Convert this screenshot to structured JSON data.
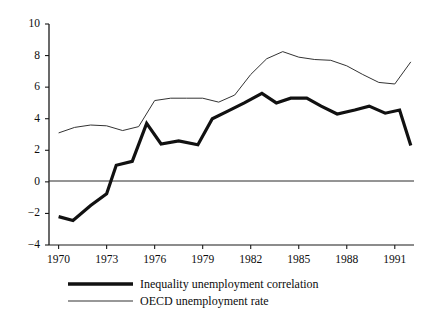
{
  "chart_data": {
    "type": "line",
    "title": "",
    "subtitle": "",
    "xlabel": "",
    "ylabel": "",
    "xlim": [
      1969.4,
      1992.2
    ],
    "ylim": [
      -4,
      10
    ],
    "grid": false,
    "legend_position": "bottom",
    "yticks": [
      10,
      8,
      6,
      4,
      2,
      0,
      -2,
      -4
    ],
    "ytick_labels": [
      "10",
      "8",
      "6",
      "4",
      "2",
      "0",
      "−2",
      "−4"
    ],
    "xticks": [
      1970,
      1973,
      1976,
      1979,
      1982,
      1985,
      1988,
      1991
    ],
    "xtick_labels": [
      "1970",
      "1973",
      "1976",
      "1979",
      "1982",
      "1985",
      "1988",
      "1991"
    ],
    "zero_line": 0,
    "x": [
      1970,
      1971,
      1972,
      1973,
      1974,
      1975,
      1975.6,
      1976.5,
      1977.5,
      1978.8,
      1979.6,
      1980.6,
      1981.6,
      1982.6,
      1983.4,
      1984.3,
      1985.3,
      1986.2,
      1987.3,
      1988.4,
      1989.3,
      1990.3,
      1991,
      1992
    ],
    "series": [
      {
        "name": "Inequality unemployment correlation",
        "style": "thick",
        "color": "#111111",
        "line_width": 3.2,
        "x": [
          1970,
          1970.9,
          1972,
          1973,
          1973.6,
          1974.6,
          1975.5,
          1976.4,
          1977.5,
          1978.7,
          1979.6,
          1980.6,
          1981.6,
          1982.7,
          1983.6,
          1984.5,
          1985.5,
          1986.4,
          1987.4,
          1988.5,
          1989.4,
          1990.4,
          1991.3,
          1992.0
        ],
        "values": [
          -2.2,
          -2.45,
          -1.5,
          -0.75,
          1.05,
          1.3,
          3.7,
          2.4,
          2.6,
          2.35,
          4.0,
          4.5,
          5.0,
          5.6,
          5.0,
          5.3,
          5.3,
          4.8,
          4.3,
          4.55,
          4.8,
          4.35,
          4.55,
          2.3
        ]
      },
      {
        "name": "OECD unemployment rate",
        "style": "thin",
        "color": "#333333",
        "line_width": 1.0,
        "x": [
          1970,
          1971,
          1972,
          1973,
          1974,
          1975,
          1976,
          1977,
          1978,
          1979,
          1980,
          1981,
          1982,
          1983,
          1984,
          1985,
          1986,
          1987,
          1988,
          1989,
          1990,
          1991,
          1992
        ],
        "values": [
          3.1,
          3.45,
          3.6,
          3.55,
          3.25,
          3.5,
          5.15,
          5.3,
          5.3,
          5.3,
          5.05,
          5.5,
          6.8,
          7.8,
          8.25,
          7.9,
          7.75,
          7.7,
          7.35,
          6.8,
          6.3,
          6.2,
          7.6
        ]
      }
    ]
  },
  "legend": {
    "items": [
      {
        "label": "Inequality unemployment correlation",
        "swatch": "thick-line-swatch"
      },
      {
        "label": "OECD unemployment rate",
        "swatch": "thin-line-swatch"
      }
    ]
  }
}
